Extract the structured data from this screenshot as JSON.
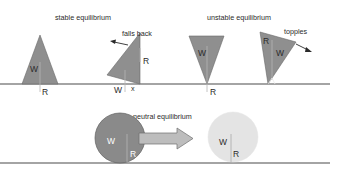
{
  "diagram": {
    "title_stable": "stable equilibrium",
    "title_unstable": "unstable equilibrium",
    "title_neutral": "neutral equilibrium",
    "annotation_falls_back": "falls back",
    "annotation_topples": "topples",
    "labels": {
      "weight": "W",
      "reaction": "R",
      "pivot": "x"
    },
    "colors": {
      "shape_fill": "#8f8f8f",
      "shape_dark_circle": "#8a8a8a",
      "shape_light_circle": "#e4e4e4",
      "arrow_fill": "#bdbdbd",
      "ground_line": "#4a4a4a",
      "text": "#2a2a2a"
    },
    "figures": [
      {
        "id": "stable-triangle",
        "state": "stable equilibrium",
        "labels": [
          "W",
          "R"
        ]
      },
      {
        "id": "falls-back-triangle",
        "state": "stable equilibrium",
        "annotation": "falls back",
        "labels": [
          "R",
          "W",
          "x"
        ]
      },
      {
        "id": "unstable-inverted-triangle",
        "state": "unstable equilibrium",
        "labels": [
          "W",
          "R"
        ]
      },
      {
        "id": "topples-triangle",
        "state": "unstable equilibrium",
        "annotation": "topples",
        "labels": [
          "R",
          "W"
        ]
      },
      {
        "id": "dark-ball",
        "state": "neutral equilibrium",
        "labels": [
          "W",
          "R"
        ]
      },
      {
        "id": "light-ball",
        "state": "neutral equilibrium",
        "labels": [
          "W",
          "R"
        ]
      }
    ]
  }
}
